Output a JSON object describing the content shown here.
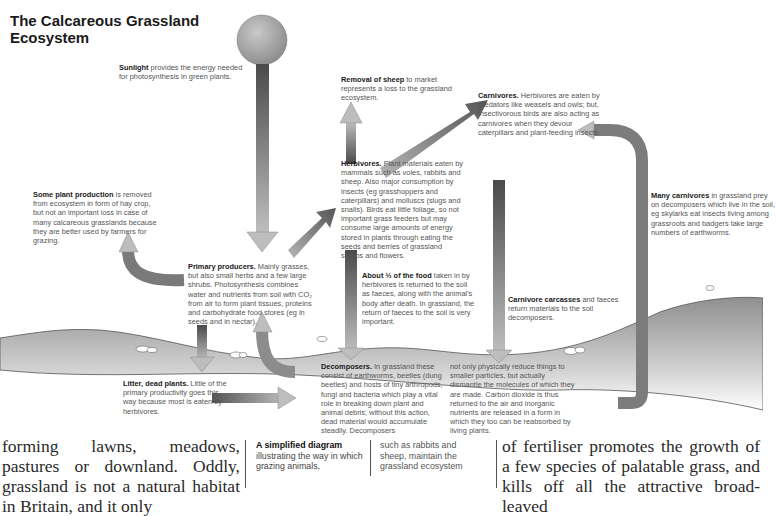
{
  "diagram": {
    "title": "The Calcareous Grassland Ecosystem",
    "labels": {
      "sunlight": {
        "bold": "Sunlight",
        "text": " provides the energy needed for photosynthesis in green plants."
      },
      "removal_of_sheep": {
        "bold": "Removal of sheep",
        "text": " to market represents a loss to the grassland ecosystem."
      },
      "carnivores": {
        "bold": "Carnivores.",
        "text": " Herbivores are eaten by predators like weasels and owls; but, insectivorous birds are also acting as carnivores when they devour caterpillars and plant-feeding insects."
      },
      "herbivores": {
        "bold": "Herbivores.",
        "text": " Plant materials eaten by mammals such as voles, rabbits and sheep. Also major consumption by insects (eg grasshoppers and caterpillars) and molluscs (slugs and snails). Birds eat little foliage, so not important grass feeders but may consume large amounts of energy stored in plants through eating the seeds and berries of grassland shrubs and flowers."
      },
      "plant_production_removed": {
        "bold": "Some plant production",
        "text": " is removed from ecosystem in form of hay crop, but not an important loss in case of many calcareous grasslands because they are better used by farmers for grazing."
      },
      "many_carnivores": {
        "bold": "Many carnivores",
        "text": " in grassland prey on decomposers which live in the soil, eg skylarks eat insects living among grassroots and badgers take large numbers of earthworms."
      },
      "primary_producers": {
        "bold": "Primary producers.",
        "text": " Mainly grasses, but also small herbs and a few large shrubs. Photosynthesis combines water and nutrients from soil with CO₂ from air to form plant tissues, proteins and carbohydrate food stores (eg in seeds and in nectar)."
      },
      "half_food": {
        "bold": "About ½ of the food",
        "text": " taken in by herbivores is returned to the soil as faeces, along with the animal's body after death. In grassland, the return of faeces to the soil is very important."
      },
      "carnivore_carcasses": {
        "bold": "Carnivore carcasses",
        "text": " and faeces return materials to the soil decomposers."
      },
      "litter": {
        "bold": "Litter, dead plants.",
        "text": " Little of the primary productivity goes this way because most is eaten by herbivores."
      },
      "decomposers_a": {
        "bold": "Decomposers.",
        "text": " In grassland these consist of earthworms, beetles (dung beetles) and hosts of tiny arthropods, fungi and bacteria which play a vital role in breaking down plant and animal debris; without this action, dead material would accumulate steadily. Decomposers"
      },
      "decomposers_b": {
        "text": "not only physically reduce things to smaller particles, but actually dismantle the molecules of which they are made. Carbon dioxide is thus returned to the air and inorganic nutrients are released in a form in which they too can be reabsorbed by living plants."
      }
    },
    "colors": {
      "arrow_dark": "#555555",
      "arrow_light": "#b5b5b5",
      "ground": "#9a9a9a",
      "sun": "#a8a8a8"
    }
  },
  "page": {
    "body_left": "forming lawns, meadows, pastures or downland. Oddly, grassland is not a natural habitat in Britain, and it only",
    "caption_a": {
      "bold": "A simplified diagram",
      "text": " illustrating the way in which grazing animals,"
    },
    "caption_b": {
      "text": "such as rabbits and sheep, maintain the grassland ecosystem"
    },
    "body_right": "of fertiliser promotes the growth of a few species of palatable grass, and kills off all the attractive broad-leaved"
  }
}
